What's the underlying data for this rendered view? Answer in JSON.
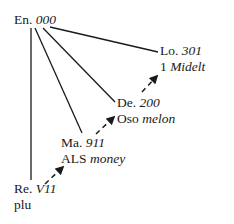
{
  "diagram": {
    "root": {
      "abbr": "En.",
      "code": "000"
    },
    "nodes": [
      {
        "abbr": "Lo.",
        "code": "301",
        "sub_plain": "1",
        "sub_italic": "Midelt"
      },
      {
        "abbr": "De.",
        "code": "200",
        "sub_plain": "Oso",
        "sub_italic": "melon"
      },
      {
        "abbr": "Ma.",
        "code": "911",
        "sub_plain": "ALS",
        "sub_italic": "money"
      },
      {
        "abbr": "Re.",
        "code": "V11",
        "sub_plain": "plu",
        "sub_italic": ""
      }
    ],
    "edges": [
      {
        "from": "En.",
        "to": "Lo.",
        "style": "solid"
      },
      {
        "from": "En.",
        "to": "De.",
        "style": "solid"
      },
      {
        "from": "En.",
        "to": "Ma.",
        "style": "solid"
      },
      {
        "from": "En.",
        "to": "Re.",
        "style": "solid"
      },
      {
        "from": "Re.",
        "to": "Ma.",
        "style": "dashed-arrow"
      },
      {
        "from": "Ma.",
        "to": "De.",
        "style": "dashed-arrow"
      },
      {
        "from": "De.",
        "to": "Lo.",
        "style": "dashed-arrow"
      }
    ],
    "colors": {
      "ink": "#1a1a1a",
      "background": "#ffffff"
    }
  }
}
